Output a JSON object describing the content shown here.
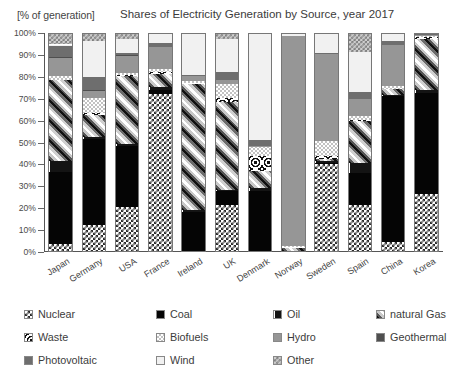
{
  "header": {
    "axis_unit": "[% of  generation]",
    "title": "Shares of Electricity Generation by Source,  year 2017"
  },
  "axis": {
    "y_ticks": [
      "0%",
      "10%",
      "20%",
      "30%",
      "40%",
      "50%",
      "60%",
      "70%",
      "80%",
      "90%",
      "100%"
    ]
  },
  "legend": {
    "rows": [
      [
        {
          "label": "Nuclear",
          "key": "nuclear"
        },
        {
          "label": "Coal",
          "key": "coal"
        },
        {
          "label": "Oil",
          "key": "oil"
        },
        {
          "label": "natural Gas",
          "key": "gas"
        }
      ],
      [
        {
          "label": "Waste",
          "key": "waste"
        },
        {
          "label": "Biofuels",
          "key": "biofuels"
        },
        {
          "label": "Hydro",
          "key": "hydro"
        },
        {
          "label": "Geothermal",
          "key": "geothermal"
        }
      ],
      [
        {
          "label": "Photovoltaic",
          "key": "photovoltaic"
        },
        {
          "label": "Wind",
          "key": "wind"
        },
        {
          "label": "Other",
          "key": "other"
        }
      ]
    ]
  },
  "chart_data": {
    "type": "bar",
    "stacked": true,
    "stack_mode": "percent",
    "title": "Shares of Electricity Generation by Source,  year 2017",
    "xlabel": "",
    "ylabel": "[% of  generation]",
    "ylim": [
      0,
      100
    ],
    "ytick_step": 10,
    "grid": false,
    "legend_position": "bottom",
    "categories": [
      "Japan",
      "Germany",
      "USA",
      "France",
      "Ireland",
      "UK",
      "Denmark",
      "Norway",
      "Sweden",
      "Spain",
      "China",
      "Korea"
    ],
    "series": [
      {
        "name": "Nuclear",
        "key": "nuclear",
        "values": [
          3.1,
          11.7,
          20.0,
          71.6,
          0.0,
          20.9,
          0.0,
          0.0,
          39.6,
          21.2,
          3.9,
          26.0
        ]
      },
      {
        "name": "Coal",
        "key": "coal",
        "values": [
          33.0,
          39.5,
          28.0,
          2.0,
          17.8,
          6.4,
          27.5,
          0.0,
          0.7,
          14.2,
          67.1,
          46.2
        ]
      },
      {
        "name": "Oil",
        "key": "oil",
        "values": [
          5.0,
          0.9,
          0.8,
          1.3,
          1.0,
          0.6,
          1.5,
          0.0,
          0.9,
          4.8,
          0.2,
          1.2
        ]
      },
      {
        "name": "natural Gas",
        "key": "gas",
        "values": [
          37.0,
          10.0,
          31.0,
          6.0,
          57.8,
          40.1,
          7.5,
          1.7,
          0.9,
          19.0,
          2.8,
          23.6
        ]
      },
      {
        "name": "Waste",
        "key": "waste",
        "values": [
          0.0,
          1.0,
          0.5,
          1.0,
          0.3,
          1.7,
          6.8,
          0.3,
          1.5,
          0.6,
          0.0,
          0.5
        ]
      },
      {
        "name": "Biofuels",
        "key": "biofuels",
        "values": [
          1.8,
          6.8,
          1.2,
          1.1,
          0.8,
          6.7,
          4.5,
          0.2,
          6.6,
          1.7,
          1.4,
          0.6
        ]
      },
      {
        "name": "Hydro",
        "key": "hydro",
        "values": [
          8.3,
          3.3,
          7.4,
          10.1,
          2.4,
          1.8,
          0.1,
          95.9,
          40.0,
          7.8,
          18.6,
          0.6
        ]
      },
      {
        "name": "Geothermal",
        "key": "geothermal",
        "values": [
          0.3,
          0.1,
          0.4,
          0.0,
          0.0,
          0.0,
          0.0,
          0.0,
          0.0,
          0.0,
          0.0,
          0.0
        ]
      },
      {
        "name": "Photovoltaic",
        "key": "photovoltaic",
        "values": [
          5.2,
          6.1,
          1.3,
          1.9,
          0.1,
          3.4,
          2.6,
          0.0,
          0.2,
          3.2,
          1.8,
          1.3
        ]
      },
      {
        "name": "Wind",
        "key": "wind",
        "values": [
          0.6,
          16.3,
          6.3,
          4.5,
          19.8,
          15.0,
          48.5,
          1.9,
          9.6,
          18.2,
          4.2,
          0.5
        ]
      },
      {
        "name": "Other",
        "key": "other",
        "values": [
          5.7,
          4.3,
          3.1,
          0.5,
          0.0,
          3.4,
          1.0,
          0.0,
          0.0,
          9.3,
          0.0,
          0.0
        ]
      }
    ]
  }
}
